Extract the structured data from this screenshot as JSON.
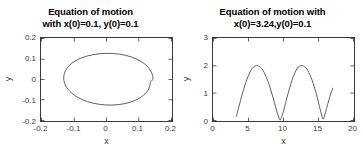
{
  "figure": {
    "background": "#ffffff",
    "axis_color": "#3a3a3a",
    "curve_color": "#4d4d4d"
  },
  "panels": [
    {
      "id": "left",
      "title_line1": "Equation of motion",
      "title_line2": "with x(0)=0.1, y(0)=0.1",
      "xlabel": "x",
      "ylabel": "y",
      "xticks": [
        "-0.2",
        "-0.1",
        "0",
        "0.1",
        "0.2"
      ],
      "yticks": [
        "0.2",
        "0.1",
        "0",
        "-0.1",
        "-0.2"
      ]
    },
    {
      "id": "right",
      "title_line1": "Equation of motion with",
      "title_line2": "x(0)=3.24,y(0)=0.1",
      "xlabel": "x",
      "ylabel": "y",
      "xticks": [
        "0",
        "5",
        "10",
        "15",
        "20"
      ],
      "yticks": [
        "3",
        "2",
        "1",
        "0"
      ]
    }
  ],
  "chart_data": [
    {
      "type": "line",
      "title": "Equation of motion with x(0)=0.1, y(0)=0.1",
      "xlabel": "x",
      "ylabel": "y",
      "xlim": [
        -0.2,
        0.2
      ],
      "ylim": [
        -0.2,
        0.2
      ],
      "xticks": [
        -0.2,
        -0.1,
        0,
        0.1,
        0.2
      ],
      "yticks": [
        -0.2,
        -0.1,
        0,
        0.1,
        0.2
      ],
      "grid": false,
      "legend": null,
      "description": "Closed phase-space orbit: near-elliptical curve centered at (0,0) with x half-width 0.142 and y half-width 0.142",
      "series": [
        {
          "name": "orbit",
          "x": [
            0.142,
            0.1406,
            0.1363,
            0.1293,
            0.1196,
            0.1074,
            0.093,
            0.0765,
            0.0584,
            0.039,
            0.0188,
            -0.0019,
            -0.0224,
            -0.0422,
            -0.0609,
            -0.078,
            -0.093,
            -0.1057,
            -0.1159,
            -0.1235,
            -0.1284,
            -0.1305,
            -0.13,
            -0.1268,
            -0.121,
            -0.1127,
            -0.1021,
            -0.0893,
            -0.0746,
            -0.0582,
            -0.0405,
            -0.0219,
            -0.0027,
            0.0166,
            0.0357,
            0.054,
            0.0712,
            0.0869,
            0.1007,
            0.1124,
            0.1217,
            0.1285,
            0.1327,
            0.1343,
            0.142
          ],
          "y": [
            0.0,
            0.0188,
            0.0371,
            0.0545,
            0.0706,
            0.0851,
            0.0977,
            0.1082,
            0.1164,
            0.1222,
            0.1254,
            0.126,
            0.124,
            0.1194,
            0.1124,
            0.1031,
            0.0916,
            0.0783,
            0.0634,
            0.0472,
            0.0302,
            0.0126,
            -0.0051,
            -0.0227,
            -0.0398,
            -0.056,
            -0.0711,
            -0.0847,
            -0.0966,
            -0.1065,
            -0.1143,
            -0.1197,
            -0.1227,
            -0.1232,
            -0.1213,
            -0.1168,
            -0.11,
            -0.1009,
            -0.0897,
            -0.0766,
            -0.0619,
            -0.0459,
            -0.029,
            -0.0116,
            0.0
          ]
        }
      ]
    },
    {
      "type": "line",
      "title": "Equation of motion with x(0)=3.24,y(0)=0.1",
      "xlabel": "x",
      "ylabel": "y",
      "xlim": [
        0,
        20
      ],
      "ylim": [
        0,
        3
      ],
      "xticks": [
        0,
        5,
        10,
        15,
        20
      ],
      "yticks": [
        0,
        1,
        2,
        3
      ],
      "grid": false,
      "legend": null,
      "description": "Oscillating trajectory starting at (3.3,0.15), two arches peaking at y=2.0 near x=6.3 and x=12.7, touching y~0 near x=9.5 and x=15.6, ending rising to y=1.2 at x=17.0",
      "series": [
        {
          "name": "trajectory",
          "x": [
            3.3,
            3.6,
            3.9,
            4.2,
            4.5,
            4.8,
            5.1,
            5.4,
            5.7,
            6.0,
            6.3,
            6.6,
            6.9,
            7.2,
            7.5,
            7.8,
            8.1,
            8.4,
            8.7,
            9.0,
            9.25,
            9.5,
            9.75,
            10.0,
            10.3,
            10.6,
            10.9,
            11.2,
            11.5,
            11.8,
            12.1,
            12.4,
            12.7,
            13.0,
            13.3,
            13.6,
            13.9,
            14.2,
            14.5,
            14.8,
            15.1,
            15.35,
            15.6,
            15.85,
            16.1,
            16.4,
            16.7,
            17.0
          ],
          "y": [
            0.15,
            0.45,
            0.74,
            1.02,
            1.27,
            1.5,
            1.69,
            1.84,
            1.94,
            1.99,
            2.0,
            1.97,
            1.9,
            1.78,
            1.62,
            1.43,
            1.2,
            0.95,
            0.68,
            0.4,
            0.2,
            0.03,
            0.16,
            0.36,
            0.66,
            0.95,
            1.22,
            1.47,
            1.68,
            1.84,
            1.95,
            1.99,
            2.0,
            1.96,
            1.88,
            1.75,
            1.58,
            1.37,
            1.12,
            0.85,
            0.52,
            0.28,
            0.07,
            0.22,
            0.45,
            0.72,
            0.98,
            1.2
          ]
        }
      ]
    }
  ]
}
